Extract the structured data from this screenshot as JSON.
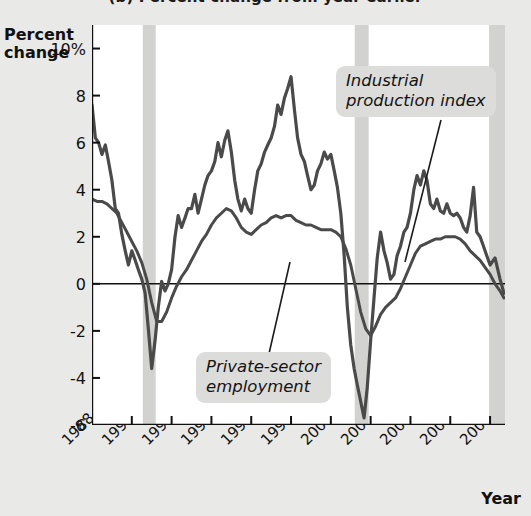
{
  "panel": {
    "title": "(b) Percent change from year earlier"
  },
  "axes": {
    "y_title_line1": "Percent",
    "y_title_line2": "change",
    "x_title": "Year"
  },
  "annotations": {
    "ipi_line1": "Industrial",
    "ipi_line2": "production index",
    "emp_line1": "Private-sector",
    "emp_line2": "employment"
  },
  "colors": {
    "page_background": "#e9e9e7",
    "plot_background": "#ffffff",
    "line": "#4a4a4a",
    "recession_band": "#d2d2d0",
    "axis": "#111111",
    "callout_background": "#dcdcda"
  },
  "chart_data": {
    "type": "line",
    "title": "(b) Percent change from year earlier",
    "xlabel": "Year",
    "ylabel": "Percent change",
    "xlim": [
      1988.0,
      2008.75
    ],
    "ylim": [
      -6,
      11
    ],
    "grid": false,
    "legend": "inline-callout-labels",
    "ytick_values": [
      10,
      8,
      6,
      4,
      2,
      0,
      -2,
      -4,
      -6
    ],
    "ytick_labels": [
      "10%",
      "8",
      "6",
      "4",
      "2",
      "0",
      "-2",
      "-4",
      "-6"
    ],
    "xtick_values": [
      1988,
      1990,
      1992,
      1994,
      1996,
      1998,
      2000,
      2002,
      2004,
      2006,
      2008
    ],
    "xtick_labels": [
      "1988",
      "1990",
      "1992",
      "1994",
      "1996",
      "1998",
      "2000",
      "2002",
      "2004",
      "2006",
      "2008"
    ],
    "zero_line": 0,
    "recession_bands": [
      {
        "start": 1990.55,
        "end": 1991.2
      },
      {
        "start": 2001.2,
        "end": 2001.9
      },
      {
        "start": 2007.95,
        "end": 2008.75
      }
    ],
    "series": [
      {
        "name": "Industrial production index",
        "color": "#4a4a4a",
        "x": [
          1988.0,
          1988.17,
          1988.33,
          1988.5,
          1988.67,
          1988.83,
          1989.0,
          1989.17,
          1989.33,
          1989.5,
          1989.67,
          1989.83,
          1990.0,
          1990.17,
          1990.33,
          1990.5,
          1990.67,
          1990.83,
          1991.0,
          1991.17,
          1991.33,
          1991.5,
          1991.67,
          1991.83,
          1992.0,
          1992.17,
          1992.33,
          1992.5,
          1992.67,
          1992.83,
          1993.0,
          1993.17,
          1993.33,
          1993.5,
          1993.67,
          1993.83,
          1994.0,
          1994.17,
          1994.33,
          1994.5,
          1994.67,
          1994.83,
          1995.0,
          1995.17,
          1995.33,
          1995.5,
          1995.67,
          1995.83,
          1996.0,
          1996.17,
          1996.33,
          1996.5,
          1996.67,
          1996.83,
          1997.0,
          1997.17,
          1997.33,
          1997.5,
          1997.67,
          1997.83,
          1998.0,
          1998.17,
          1998.33,
          1998.5,
          1998.67,
          1998.83,
          1999.0,
          1999.17,
          1999.33,
          1999.5,
          1999.67,
          1999.83,
          2000.0,
          2000.17,
          2000.33,
          2000.5,
          2000.67,
          2000.83,
          2001.0,
          2001.17,
          2001.33,
          2001.5,
          2001.67,
          2001.83,
          2002.0,
          2002.17,
          2002.33,
          2002.5,
          2002.67,
          2002.83,
          2003.0,
          2003.17,
          2003.33,
          2003.5,
          2003.67,
          2003.83,
          2004.0,
          2004.17,
          2004.33,
          2004.5,
          2004.67,
          2004.83,
          2005.0,
          2005.17,
          2005.33,
          2005.5,
          2005.67,
          2005.83,
          2006.0,
          2006.17,
          2006.33,
          2006.5,
          2006.67,
          2006.83,
          2007.0,
          2007.17,
          2007.33,
          2007.5,
          2007.67,
          2007.83,
          2008.0,
          2008.25,
          2008.5,
          2008.7
        ],
        "y": [
          7.6,
          6.2,
          6.0,
          5.5,
          5.9,
          5.2,
          4.4,
          3.2,
          3.0,
          2.1,
          1.4,
          0.8,
          1.4,
          1.0,
          0.6,
          0.2,
          -0.4,
          -1.9,
          -3.6,
          -2.4,
          -1.0,
          0.1,
          -0.3,
          0.0,
          0.6,
          2.0,
          2.9,
          2.4,
          2.8,
          3.2,
          3.2,
          3.8,
          3.0,
          3.6,
          4.2,
          4.6,
          4.8,
          5.2,
          6.0,
          5.4,
          6.1,
          6.5,
          5.6,
          4.4,
          3.6,
          3.1,
          3.6,
          3.2,
          3.0,
          4.0,
          4.8,
          5.1,
          5.6,
          5.9,
          6.2,
          6.7,
          7.6,
          7.2,
          7.9,
          8.3,
          8.8,
          7.4,
          6.2,
          5.5,
          5.2,
          4.6,
          4.0,
          4.2,
          4.8,
          5.1,
          5.6,
          5.3,
          5.5,
          4.8,
          4.1,
          3.0,
          1.2,
          -1.0,
          -2.6,
          -3.6,
          -4.3,
          -5.0,
          -5.7,
          -4.4,
          -2.4,
          -0.6,
          1.1,
          2.2,
          1.4,
          0.9,
          0.2,
          0.4,
          1.2,
          1.6,
          2.2,
          2.4,
          3.0,
          4.0,
          4.6,
          4.2,
          4.8,
          4.4,
          3.4,
          3.2,
          3.6,
          3.1,
          3.0,
          3.4,
          3.0,
          2.9,
          3.0,
          2.8,
          2.4,
          2.2,
          2.9,
          4.1,
          2.2,
          2.0,
          1.6,
          1.2,
          0.8,
          1.1,
          0.2,
          -0.4
        ]
      },
      {
        "name": "Private-sector employment",
        "color": "#4a4a4a",
        "x": [
          1988.0,
          1988.25,
          1988.5,
          1988.75,
          1989.0,
          1989.25,
          1989.5,
          1989.75,
          1990.0,
          1990.25,
          1990.5,
          1990.75,
          1991.0,
          1991.25,
          1991.5,
          1991.75,
          1992.0,
          1992.25,
          1992.5,
          1992.75,
          1993.0,
          1993.25,
          1993.5,
          1993.75,
          1994.0,
          1994.25,
          1994.5,
          1994.75,
          1995.0,
          1995.25,
          1995.5,
          1995.75,
          1996.0,
          1996.25,
          1996.5,
          1996.75,
          1997.0,
          1997.25,
          1997.5,
          1997.75,
          1998.0,
          1998.25,
          1998.5,
          1998.75,
          1999.0,
          1999.25,
          1999.5,
          1999.75,
          2000.0,
          2000.25,
          2000.5,
          2000.75,
          2001.0,
          2001.25,
          2001.5,
          2001.75,
          2002.0,
          2002.25,
          2002.5,
          2002.75,
          2003.0,
          2003.25,
          2003.5,
          2003.75,
          2004.0,
          2004.25,
          2004.5,
          2004.75,
          2005.0,
          2005.25,
          2005.5,
          2005.75,
          2006.0,
          2006.25,
          2006.5,
          2006.75,
          2007.0,
          2007.25,
          2007.5,
          2007.75,
          2008.0,
          2008.25,
          2008.5,
          2008.7
        ],
        "y": [
          3.6,
          3.5,
          3.5,
          3.4,
          3.2,
          3.0,
          2.6,
          2.2,
          1.8,
          1.4,
          0.9,
          0.2,
          -0.8,
          -1.6,
          -1.6,
          -1.2,
          -0.6,
          -0.1,
          0.3,
          0.6,
          1.0,
          1.4,
          1.8,
          2.1,
          2.5,
          2.8,
          3.0,
          3.2,
          3.1,
          2.8,
          2.4,
          2.2,
          2.1,
          2.3,
          2.5,
          2.6,
          2.8,
          2.9,
          2.8,
          2.9,
          2.9,
          2.7,
          2.6,
          2.5,
          2.5,
          2.4,
          2.3,
          2.3,
          2.3,
          2.2,
          2.0,
          1.5,
          0.8,
          -0.2,
          -1.2,
          -1.9,
          -2.2,
          -1.8,
          -1.3,
          -1.0,
          -0.8,
          -0.6,
          -0.2,
          0.3,
          0.8,
          1.3,
          1.6,
          1.7,
          1.8,
          1.9,
          1.9,
          2.0,
          2.0,
          2.0,
          1.9,
          1.7,
          1.4,
          1.2,
          1.0,
          0.7,
          0.4,
          0.0,
          -0.3,
          -0.6
        ]
      }
    ]
  }
}
